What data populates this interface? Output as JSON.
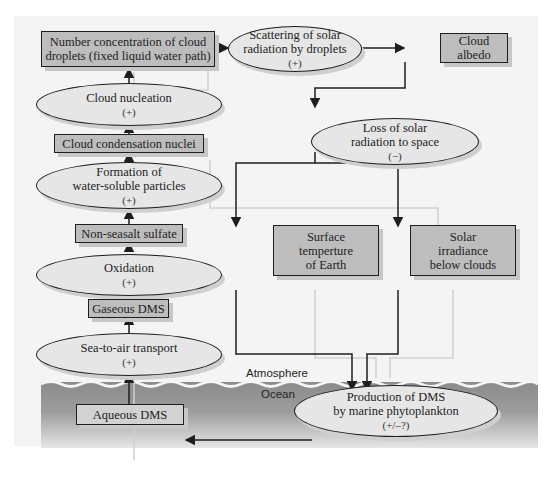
{
  "diagram": {
    "regions": {
      "atmosphere_label": "Atmosphere",
      "ocean_label": "Ocean"
    },
    "nodes": {
      "number_concentration": {
        "lines": [
          "Number concentration of cloud",
          "droplets (fixed liquid water path)"
        ],
        "shape": "box"
      },
      "cloud_nucleation": {
        "lines": [
          "Cloud nucleation"
        ],
        "sign": "(+)",
        "shape": "ellipse"
      },
      "ccn": {
        "lines": [
          "Cloud condensation nuclei"
        ],
        "shape": "box"
      },
      "formation_particles": {
        "lines": [
          "Formation of",
          "water-soluble particles"
        ],
        "sign": "(+)",
        "shape": "ellipse"
      },
      "nss_sulfate": {
        "lines": [
          "Non-seasalt sulfate"
        ],
        "shape": "box"
      },
      "oxidation": {
        "lines": [
          "Oxidation"
        ],
        "sign": "(+)",
        "shape": "ellipse"
      },
      "gaseous_dms": {
        "lines": [
          "Gaseous DMS"
        ],
        "shape": "box"
      },
      "sea_to_air": {
        "lines": [
          "Sea-to-air transport"
        ],
        "sign": "(+)",
        "shape": "ellipse"
      },
      "aqueous_dms": {
        "lines": [
          "Aqueous DMS"
        ],
        "shape": "box"
      },
      "scattering": {
        "lines": [
          "Scattering of solar",
          "radiation by droplets"
        ],
        "sign": "(+)",
        "shape": "ellipse"
      },
      "cloud_albedo": {
        "lines": [
          "Cloud",
          "albedo"
        ],
        "shape": "box"
      },
      "loss_solar": {
        "lines": [
          "Loss of solar",
          "radiation to space"
        ],
        "sign": "(−)",
        "shape": "ellipse"
      },
      "surface_temp": {
        "lines": [
          "Surface",
          "temperture",
          "of Earth"
        ],
        "shape": "box"
      },
      "solar_irradiance": {
        "lines": [
          "Solar",
          "irradiance",
          "below clouds"
        ],
        "shape": "box"
      },
      "production_dms": {
        "lines": [
          "Production of DMS",
          "by marine phytoplankton"
        ],
        "sign": "(+/–?)",
        "shape": "ellipse"
      }
    },
    "edges": [
      [
        "aqueous_dms",
        "sea_to_air"
      ],
      [
        "sea_to_air",
        "gaseous_dms"
      ],
      [
        "gaseous_dms",
        "oxidation"
      ],
      [
        "oxidation",
        "nss_sulfate"
      ],
      [
        "nss_sulfate",
        "formation_particles"
      ],
      [
        "formation_particles",
        "ccn"
      ],
      [
        "ccn",
        "cloud_nucleation"
      ],
      [
        "cloud_nucleation",
        "number_concentration"
      ],
      [
        "number_concentration",
        "scattering"
      ],
      [
        "scattering",
        "cloud_albedo"
      ],
      [
        "cloud_albedo",
        "loss_solar"
      ],
      [
        "loss_solar",
        "surface_temp"
      ],
      [
        "loss_solar",
        "solar_irradiance"
      ],
      [
        "surface_temp",
        "production_dms"
      ],
      [
        "solar_irradiance",
        "production_dms"
      ],
      [
        "production_dms",
        "aqueous_dms"
      ]
    ],
    "colors": {
      "box_fill": "#bdbdbd",
      "ellipse_fill": "#e6e6e6",
      "stroke": "#1e1e1e",
      "panel": "#f4f4f4",
      "ocean_top": "#8c8c8c"
    }
  }
}
